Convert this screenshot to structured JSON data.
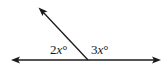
{
  "diagram": {
    "type": "angle-pair",
    "angles": [
      {
        "label_coef": "2",
        "label_var": "x",
        "label_unit": "°",
        "position": "left"
      },
      {
        "label_coef": "3",
        "label_var": "x",
        "label_unit": "°",
        "position": "right"
      }
    ],
    "line": {
      "arrows": "both"
    },
    "ray": {
      "arrow": true,
      "direction": "up-left"
    },
    "stroke_color": "#1a1a1a"
  }
}
